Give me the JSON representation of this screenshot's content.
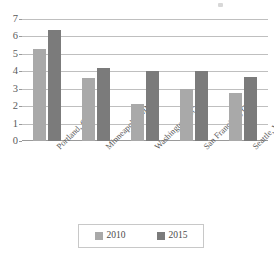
{
  "chart_data": {
    "type": "bar",
    "title": "",
    "xlabel": "",
    "ylabel": "",
    "categories": [
      "Portland, OR",
      "Minneapolis, MN",
      "Washington, DC",
      "San Francisco, CA",
      "Seattle, WA"
    ],
    "series": [
      {
        "name": "2010",
        "color": "#a9a9a9",
        "values": [
          5.3,
          3.6,
          2.1,
          3.0,
          2.75
        ]
      },
      {
        "name": "2015",
        "color": "#7b7b7b",
        "values": [
          6.35,
          4.2,
          4.0,
          4.0,
          3.7
        ]
      }
    ],
    "ylim": [
      0,
      7
    ],
    "yticks": [
      0,
      1,
      2,
      3,
      4,
      5,
      6,
      7
    ],
    "ytick_labels": [
      "0",
      "1",
      "2",
      "3",
      "4",
      "5",
      "6",
      "7"
    ],
    "grid": true,
    "grid_color": "#bfbfbf",
    "legend_position": "bottom",
    "xtick_rotation": -45
  },
  "legend": {
    "items": [
      {
        "label": "2010",
        "swatch": "legend-swatch-2010"
      },
      {
        "label": "2015",
        "swatch": "legend-swatch-2015"
      }
    ]
  }
}
